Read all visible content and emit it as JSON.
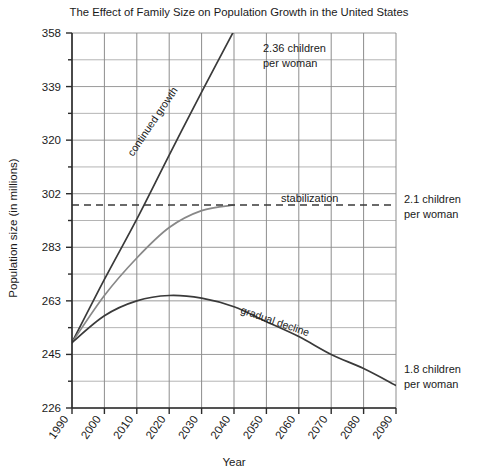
{
  "chart_data": {
    "type": "line",
    "title": "The Effect of Family Size on Population Growth in the United States",
    "xlabel": "Year",
    "ylabel": "Population size (in millions)",
    "xlim": [
      1990,
      2090
    ],
    "ylim": [
      226,
      358
    ],
    "grid": true,
    "legend": "none",
    "x_ticks": [
      "1990",
      "2000",
      "2010",
      "2020",
      "2030",
      "2040",
      "2050",
      "2060",
      "2070",
      "2080",
      "2090"
    ],
    "y_ticks": [
      "226",
      "245",
      "263",
      "283",
      "302",
      "320",
      "339",
      "358"
    ],
    "y_minor_ticks_between": 1,
    "reference_line": {
      "label": "stabilization",
      "value": 298,
      "style": "dashed",
      "x_start": 1990,
      "x_end": 2090
    },
    "series": [
      {
        "name": "continued growth",
        "label": "continued growth",
        "right_label": "2.36 children per woman",
        "color": "#3a3a3a",
        "width": 1.7,
        "x": [
          1990,
          2000,
          2010,
          2020,
          2030,
          2041
        ],
        "y": [
          249,
          271,
          293,
          315,
          337,
          361
        ]
      },
      {
        "name": "stabilization",
        "label": "",
        "right_label": "2.1 children per woman",
        "color": "#888888",
        "width": 1.7,
        "x": [
          1990,
          2000,
          2010,
          2020,
          2030,
          2040
        ],
        "y": [
          249,
          265,
          279,
          290,
          296,
          298
        ]
      },
      {
        "name": "gradual decline",
        "label": "gradual decline",
        "right_label": "1.8 children per woman",
        "color": "#3a3a3a",
        "width": 1.7,
        "x": [
          1990,
          2000,
          2010,
          2020,
          2030,
          2040,
          2050,
          2060,
          2070,
          2080,
          2090
        ],
        "y": [
          249,
          258,
          263,
          265,
          264,
          261,
          256,
          251,
          245,
          240,
          234
        ]
      }
    ],
    "annotations": [
      {
        "name": "right-label-236",
        "text_line1": "2.36 children",
        "text_line2": "per woman"
      },
      {
        "name": "right-label-21",
        "text_line1": "2.1 children",
        "text_line2": "per woman"
      },
      {
        "name": "right-label-18",
        "text_line1": "1.8 children",
        "text_line2": "per woman"
      },
      {
        "name": "inline-continued-growth",
        "text": "continued growth"
      },
      {
        "name": "inline-stabilization",
        "text": "stabilization"
      },
      {
        "name": "inline-gradual-decline",
        "text": "gradual decline"
      }
    ]
  }
}
